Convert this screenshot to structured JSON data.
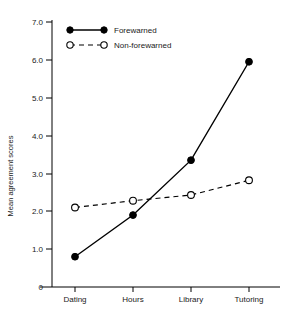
{
  "chart_data": {
    "type": "line",
    "title": "",
    "subtitle": "",
    "xlabel": "",
    "ylabel": "Mean agreement scores",
    "categories": [
      "Dating",
      "Hours",
      "Library",
      "Tutoring"
    ],
    "ylim": [
      0,
      7.0
    ],
    "ytick_labels": [
      "0",
      "1.0",
      "2.0",
      "3.0",
      "4.0",
      "5.0",
      "6.0",
      "7.0"
    ],
    "ytick_values": [
      0,
      1.0,
      2.0,
      3.0,
      4.0,
      5.0,
      6.0,
      7.0
    ],
    "grid": false,
    "legend_position": "top-left",
    "series": [
      {
        "name": "Forewarned",
        "values": [
          0.8,
          1.9,
          3.35,
          5.95
        ],
        "marker": "filled-circle",
        "line_style": "solid",
        "color": "#000000"
      },
      {
        "name": "Non-forewarned",
        "values": [
          2.1,
          2.28,
          2.43,
          2.82
        ],
        "marker": "open-circle",
        "line_style": "dashed",
        "color": "#000000"
      }
    ]
  },
  "legend": {
    "entries": [
      {
        "label": "Forewarned"
      },
      {
        "label": "Non-forewarned"
      }
    ]
  },
  "axes": {
    "y_title": "Mean agreement scores"
  },
  "colors": {
    "ink": "#000000",
    "background": "#ffffff"
  }
}
